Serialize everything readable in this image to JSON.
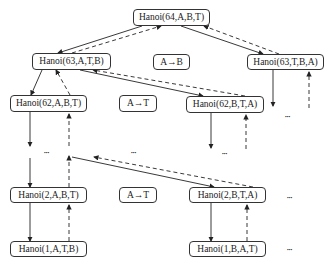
{
  "diagram": {
    "title": "",
    "nodes": [
      {
        "id": "n64",
        "label": "Hanoi(64,A,B,T)",
        "x": 133,
        "y": 9,
        "w": 77,
        "h": 17
      },
      {
        "id": "n63a",
        "label": "Hanoi(63,A,T,B)",
        "x": 32,
        "y": 53,
        "w": 79,
        "h": 17
      },
      {
        "id": "mAB",
        "label": "A→B",
        "x": 153,
        "y": 54,
        "w": 37,
        "h": 16
      },
      {
        "id": "n63b",
        "label": "Hanoi(63,T,B,A)",
        "x": 247,
        "y": 54,
        "w": 77,
        "h": 16
      },
      {
        "id": "n62a",
        "label": "Hanoi(62,A,B,T)",
        "x": 10,
        "y": 95,
        "w": 77,
        "h": 17
      },
      {
        "id": "mAT1",
        "label": "A→T",
        "x": 119,
        "y": 95,
        "w": 38,
        "h": 17
      },
      {
        "id": "n62b",
        "label": "Hanoi(62,B,T,A)",
        "x": 186,
        "y": 96,
        "w": 78,
        "h": 17
      },
      {
        "id": "n2a",
        "label": "Hanoi(2,A,B,T)",
        "x": 10,
        "y": 187,
        "w": 77,
        "h": 16
      },
      {
        "id": "mAT2",
        "label": "A→T",
        "x": 119,
        "y": 187,
        "w": 38,
        "h": 16
      },
      {
        "id": "n2b",
        "label": "Hanoi(2,B,T,A)",
        "x": 189,
        "y": 187,
        "w": 77,
        "h": 16
      },
      {
        "id": "n1a",
        "label": "Hanoi(1,A,T,B)",
        "x": 10,
        "y": 241,
        "w": 77,
        "h": 16
      },
      {
        "id": "n1b",
        "label": "Hanoi(1,B,A,T)",
        "x": 189,
        "y": 241,
        "w": 77,
        "h": 16
      }
    ],
    "ellipses": [
      {
        "text": "•••",
        "x": 44,
        "y": 149
      },
      {
        "text": "•••",
        "x": 131,
        "y": 149
      },
      {
        "text": "•••",
        "x": 222,
        "y": 150
      },
      {
        "text": "•••",
        "x": 285,
        "y": 113
      },
      {
        "text": "•••",
        "x": 287,
        "y": 194
      },
      {
        "text": "•••",
        "x": 287,
        "y": 246
      }
    ],
    "edge_legend": {
      "solid": "call (descend)",
      "dashed": "return (ascend)"
    }
  }
}
